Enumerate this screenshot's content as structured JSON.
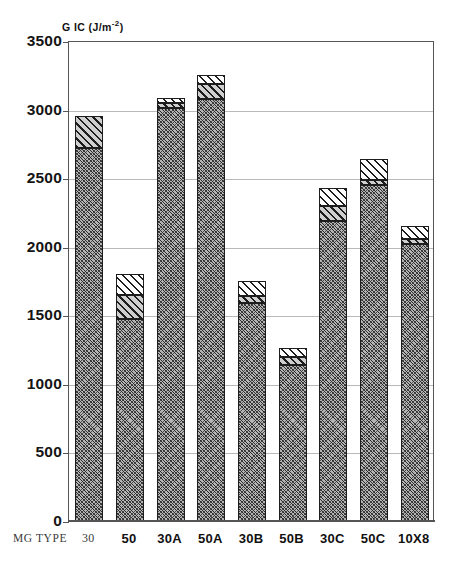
{
  "chart_data": {
    "type": "bar",
    "stacked": true,
    "title": "",
    "xlabel": "MG TYPE",
    "ylabel": "G IC (J/m-2)",
    "ylabel_base": "G IC (J/m",
    "ylabel_sup": "-2",
    "ylabel_close": ")",
    "ylim": [
      0,
      3500
    ],
    "ytick_step": 500,
    "yticks": [
      "3500",
      "3000",
      "2500",
      "2000",
      "1500",
      "1000",
      "500",
      "0"
    ],
    "ytick_values": [
      3500,
      3000,
      2500,
      2000,
      1500,
      1000,
      500,
      0
    ],
    "grid": true,
    "grid_axis": "y",
    "legend": "none",
    "categories": [
      "30",
      "50",
      "30A",
      "50A",
      "30B",
      "50B",
      "30C",
      "50C",
      "10X8"
    ],
    "series": [
      {
        "name": "lower",
        "pattern": "grey-crosshatch",
        "values": [
          2720,
          1470,
          3010,
          3080,
          1590,
          1140,
          2190,
          2450,
          2020
        ]
      },
      {
        "name": "middle",
        "pattern": "dark-diagonal-hatch",
        "values": [
          230,
          180,
          35,
          110,
          50,
          55,
          105,
          40,
          35
        ]
      },
      {
        "name": "upper",
        "pattern": "white-diagonal-hatch",
        "values": [
          0,
          150,
          40,
          60,
          110,
          70,
          130,
          150,
          95
        ]
      }
    ],
    "totals": [
      2950,
      1800,
      3085,
      3250,
      1750,
      1265,
      2425,
      2640,
      2150
    ],
    "bar_tops": [
      2950,
      1800,
      3085,
      3250,
      1750,
      1265,
      2425,
      2640,
      2150
    ],
    "segment_boundaries": [
      {
        "category": "30",
        "bottom_top": 2720,
        "middle_top": 2950,
        "total": 2950
      },
      {
        "category": "50",
        "bottom_top": 1470,
        "middle_top": 1650,
        "total": 1800
      },
      {
        "category": "30A",
        "bottom_top": 3010,
        "middle_top": 3045,
        "total": 3085
      },
      {
        "category": "50A",
        "bottom_top": 3080,
        "middle_top": 3190,
        "total": 3250
      },
      {
        "category": "30B",
        "bottom_top": 1590,
        "middle_top": 1640,
        "total": 1750
      },
      {
        "category": "50B",
        "bottom_top": 1140,
        "middle_top": 1195,
        "total": 1265
      },
      {
        "category": "30C",
        "bottom_top": 2190,
        "middle_top": 2295,
        "total": 2425
      },
      {
        "category": "50C",
        "bottom_top": 2450,
        "middle_top": 2490,
        "total": 2640
      },
      {
        "category": "10X8",
        "bottom_top": 2020,
        "middle_top": 2055,
        "total": 2150
      }
    ]
  },
  "axis": {
    "y_title_base": "G IC (J/m",
    "y_title_sup": "-2",
    "y_title_close": ")",
    "x_row_label": "MG TYPE"
  },
  "xlabels": [
    {
      "text": "30",
      "style": "serif"
    },
    {
      "text": "50",
      "style": "bold"
    },
    {
      "text": "30A",
      "style": "bold"
    },
    {
      "text": "50A",
      "style": "bold"
    },
    {
      "text": "30B",
      "style": "bold"
    },
    {
      "text": "50B",
      "style": "bold"
    },
    {
      "text": "30C",
      "style": "bold"
    },
    {
      "text": "50C",
      "style": "bold"
    },
    {
      "text": "10X8",
      "style": "bold"
    }
  ],
  "colors": {
    "axis": "#555555",
    "grid": "#b9b9b9",
    "hatch": "#1d1d1d",
    "fill_bottom": "#b4b4b4",
    "fill_middle": "#cfcfcf",
    "fill_top": "#ffffff",
    "text": "#111111"
  }
}
